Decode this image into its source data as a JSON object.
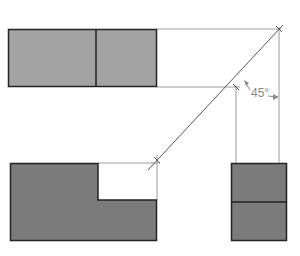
{
  "diagram": {
    "angle_label": "45°",
    "colors": {
      "background": "#ffffff",
      "top_view_fill": "#a3a3a3",
      "front_view_fill": "#7b7b7b",
      "side_view_fill": "#7b7b7b",
      "outline": "#222222",
      "projection_line": "#9a9a9a",
      "miter_line": "#555555",
      "label": "#8a8a8a"
    },
    "views": [
      {
        "name": "top-view",
        "shape": "rectangle",
        "x": 8,
        "y": 29,
        "w": 149,
        "h": 58,
        "divider_x": 96
      },
      {
        "name": "front-view",
        "shape": "L-shape",
        "x": 10,
        "y": 163,
        "w": 147,
        "h": 78,
        "notch": {
          "x": 98,
          "y": 163,
          "w": 59,
          "h": 37
        }
      },
      {
        "name": "side-view",
        "shape": "rectangle",
        "x": 231,
        "y": 163,
        "w": 56,
        "h": 78,
        "divider_y": 202
      }
    ]
  }
}
